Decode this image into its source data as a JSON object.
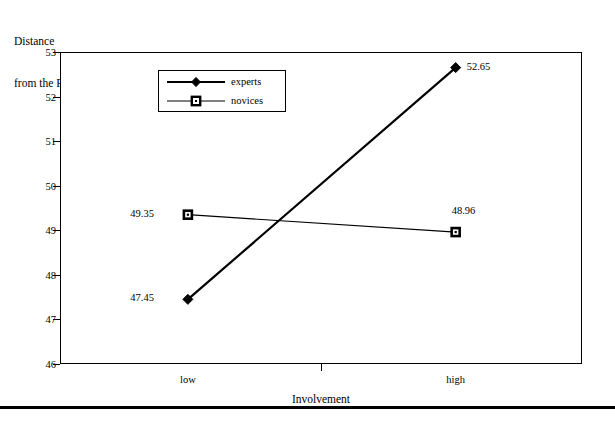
{
  "chart_data": {
    "type": "line",
    "title": "",
    "ylabel": "Distance\nfrom the PIF",
    "ylabel_lines": [
      "Distance",
      "from the PIF"
    ],
    "xlabel": "Involvement",
    "categories": [
      "low",
      "high"
    ],
    "ylim": [
      46,
      53
    ],
    "yticks": [
      53,
      52,
      51,
      50,
      49,
      48,
      47,
      46
    ],
    "ytick_labels": [
      "53",
      "52",
      "51",
      "50",
      "49",
      "48",
      "47",
      "46"
    ],
    "grid": false,
    "legend_position": "upper-left-inside",
    "series": [
      {
        "name": "experts",
        "values": [
          47.45,
          52.65
        ],
        "labels": [
          "47.45",
          "52.65"
        ],
        "marker": "diamond",
        "color": "#000000",
        "line_width": 2.2
      },
      {
        "name": "novices",
        "values": [
          49.35,
          48.96
        ],
        "labels": [
          "49.35",
          "48.96"
        ],
        "marker": "square",
        "color": "#000000",
        "line_width": 1.2
      }
    ]
  },
  "legend": {
    "items": [
      {
        "label": "experts",
        "marker": "diamond-marker-icon"
      },
      {
        "label": "novices",
        "marker": "square-marker-icon"
      }
    ]
  },
  "axes": {
    "y_title_line1": "Distance",
    "y_title_line2": "from the PIF",
    "x_title": "Involvement",
    "x_categories": [
      "low",
      "high"
    ],
    "y_ticks": [
      "53",
      "52",
      "51",
      "50",
      "49",
      "48",
      "47",
      "46"
    ]
  },
  "point_labels": {
    "experts_low": "47.45",
    "experts_high": "52.65",
    "novices_low": "49.35",
    "novices_high": "48.96"
  },
  "colors": {
    "ink": "#000000",
    "background": "#ffffff"
  }
}
